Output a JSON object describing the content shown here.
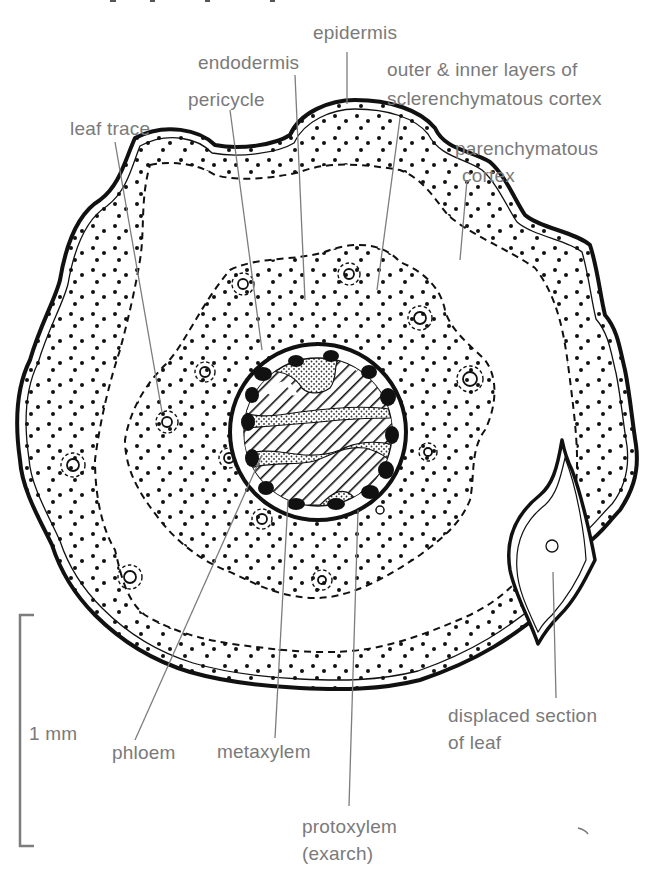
{
  "figure": {
    "type": "stem transverse section",
    "labels": {
      "epidermis": "epidermis",
      "endodermis": "endodermis",
      "outer_inner_line1": "outer & inner layers of",
      "outer_inner_line2": "sclerenchymatous cortex",
      "pericycle": "pericycle",
      "leaf_trace": "leaf trace",
      "parenchymatous_line1": "parenchymatous",
      "parenchymatous_line2": "cortex",
      "displaced_line1": "displaced section",
      "displaced_line2": "of leaf",
      "phloem": "phloem",
      "metaxylem": "metaxylem",
      "protoxylem_line1": "protoxylem",
      "protoxylem_line2": "(exarch)"
    },
    "scale_bar": {
      "label": "1 mm"
    }
  },
  "colors": {
    "ink": "#111111",
    "label_gray": "#7a7a7a",
    "background": "#ffffff"
  }
}
